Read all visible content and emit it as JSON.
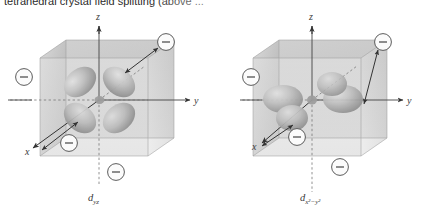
{
  "figure": {
    "caption_clipped": "tetrahedral crystal field splitting (above ...",
    "background_color": "#ffffff",
    "ink_color": "#3a3a3a",
    "cube_face_color": "#b9b9b9",
    "lobe_color": "#a9a9a9"
  },
  "diagrams": [
    {
      "id": "left",
      "orbital_label": "d",
      "orbital_sub": "yz",
      "orbital_sub_sup": "",
      "axes": [
        {
          "name": "z-axis",
          "label": "z",
          "direction": "up"
        },
        {
          "name": "y-axis",
          "label": "y",
          "direction": "right"
        },
        {
          "name": "x-axis",
          "label": "x",
          "direction": "front-left"
        }
      ],
      "ligands": [
        {
          "name": "ligand-top-right",
          "label": "−"
        },
        {
          "name": "ligand-left",
          "label": "−"
        },
        {
          "name": "ligand-front-center",
          "label": "−"
        },
        {
          "name": "ligand-bottom",
          "label": "−"
        }
      ],
      "distance_arrows": 2,
      "lobe_orientation": "between-axes"
    },
    {
      "id": "right",
      "orbital_label": "d",
      "orbital_sub": "x",
      "orbital_sub_sup": "2−y2",
      "axes": [
        {
          "name": "z-axis",
          "label": "z",
          "direction": "up"
        },
        {
          "name": "y-axis",
          "label": "y",
          "direction": "right"
        },
        {
          "name": "x-axis",
          "label": "x",
          "direction": "front-left"
        }
      ],
      "ligands": [
        {
          "name": "ligand-top-right",
          "label": "−"
        },
        {
          "name": "ligand-left",
          "label": "−"
        },
        {
          "name": "ligand-front-center",
          "label": "−"
        },
        {
          "name": "ligand-bottom",
          "label": "−"
        }
      ],
      "distance_arrows": 2,
      "lobe_orientation": "along-axes"
    }
  ]
}
